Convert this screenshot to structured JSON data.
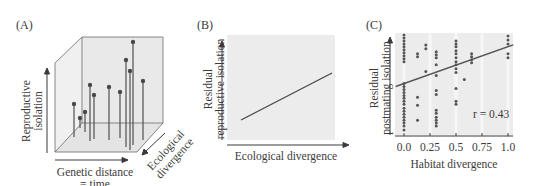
{
  "chart_data": [
    {
      "id": "A",
      "type": "scatter",
      "panel_label": "(A)",
      "title": "",
      "xlabel": "Genetic distance = time",
      "ylabel": "Reproductive isolation",
      "zlabel": "Ecological divergence",
      "grid": false,
      "description": "3D stick plot: points above a floor plane",
      "points_screen": [
        [
          74,
          104
        ],
        [
          82,
          119
        ],
        [
          87,
          112
        ],
        [
          92,
          86
        ],
        [
          95,
          95
        ],
        [
          110,
          86
        ],
        [
          122,
          92
        ],
        [
          127,
          60
        ],
        [
          132,
          42
        ],
        [
          130,
          70
        ],
        [
          143,
          81
        ]
      ]
    },
    {
      "id": "B",
      "type": "line",
      "panel_label": "(B)",
      "title": "",
      "xlabel": "Ecological divergence",
      "ylabel": "Residual reproductive isolation",
      "grid": false,
      "series": [
        {
          "name": "trend",
          "x": [
            0.1,
            0.95
          ],
          "y": [
            0.2,
            0.65
          ]
        }
      ]
    },
    {
      "id": "C",
      "type": "scatter",
      "panel_label": "(C)",
      "title": "",
      "xlabel": "Habitat divergence",
      "ylabel": "Residual postmating isolation",
      "xticks": [
        "0.0",
        "0.25",
        "0.5",
        "0.75",
        "1.0"
      ],
      "xlim": [
        -0.08,
        1.05
      ],
      "grid": true,
      "annotation": "r = 0.43",
      "regression": {
        "x": [
          -0.08,
          1.05
        ],
        "y": [
          0.47,
          0.89
        ]
      },
      "points": [
        {
          "x": 0.0,
          "y": [
            0.99,
            0.96,
            0.93,
            0.9,
            0.87,
            0.84,
            0.81,
            0.78,
            0.75,
            0.72,
            0.5,
            0.47,
            0.44,
            0.41,
            0.38,
            0.35,
            0.32,
            0.29,
            0.25,
            0.22,
            0.19,
            0.16,
            0.13,
            0.1,
            0.07,
            0.03
          ]
        },
        {
          "x": 0.13,
          "y": [
            0.8,
            0.77,
            0.36,
            0.28,
            0.13
          ]
        },
        {
          "x": 0.21,
          "y": [
            0.89,
            0.85,
            0.62
          ]
        },
        {
          "x": 0.31,
          "y": [
            0.82,
            0.79,
            0.76,
            0.69,
            0.58,
            0.43,
            0.39,
            0.23,
            0.2,
            0.16,
            0.13,
            0.1,
            0.07
          ]
        },
        {
          "x": 0.5,
          "y": [
            0.93,
            0.9,
            0.87,
            0.83,
            0.8,
            0.76,
            0.72,
            0.69,
            0.65,
            0.61,
            0.45,
            0.32,
            0.29
          ]
        },
        {
          "x": 0.58,
          "y": [
            0.54
          ]
        },
        {
          "x": 0.65,
          "y": [
            0.8,
            0.77,
            0.74,
            0.71
          ]
        },
        {
          "x": 1.0,
          "y": [
            0.98,
            0.94,
            0.9,
            0.8,
            0.76
          ]
        }
      ]
    }
  ],
  "panels": {
    "a": {
      "label": "(A)",
      "ylabel_1": "Reproductive",
      "ylabel_2": "isolation",
      "xlabel_1": "Genetic distance",
      "xlabel_2": "= time",
      "zlabel_1": "Ecological",
      "zlabel_2": "divergence"
    },
    "b": {
      "label": "(B)",
      "ylabel_1": "Residual",
      "ylabel_2": "reproductive isolation",
      "xlabel": "Ecological divergence"
    },
    "c": {
      "label": "(C)",
      "ylabel_1": "Residual",
      "ylabel_2": "postmating isolation",
      "xlabel": "Habitat divergence",
      "annotation": "r = 0.43",
      "ticks": [
        "0.0",
        "0.25",
        "0.5",
        "0.75",
        "1.0"
      ]
    }
  },
  "colors": {
    "panel_bg": "#ececec",
    "ink": "#3a3a3a",
    "dot": "#555555",
    "grid": "#f6f6f6"
  }
}
